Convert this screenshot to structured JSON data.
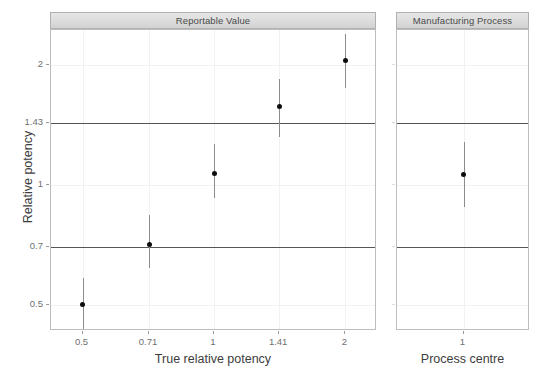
{
  "chart_data": {
    "type": "scatter",
    "title": "",
    "ylabel": "Relative potency",
    "yscale": "log",
    "ylim": [
      0.43,
      2.45
    ],
    "y_ticks": [
      {
        "label": "2",
        "value": 2
      },
      {
        "label": "1.43",
        "value": 1.43
      },
      {
        "label": "1",
        "value": 1
      },
      {
        "label": "0.7",
        "value": 0.7
      },
      {
        "label": "0.5",
        "value": 0.5
      }
    ],
    "reference_lines": [
      {
        "label": "1.43",
        "value": 1.43
      },
      {
        "label": "0.7",
        "value": 0.7
      }
    ],
    "grid": true,
    "legend": "none",
    "panels": [
      {
        "strip_label": "Reportable Value",
        "xlabel": "True relative potency",
        "x_ticks": [
          {
            "label": "0.5",
            "value": 0.5
          },
          {
            "label": "0.71",
            "value": 0.71
          },
          {
            "label": "1",
            "value": 1
          },
          {
            "label": "1.41",
            "value": 1.41
          },
          {
            "label": "2",
            "value": 2
          }
        ],
        "points": [
          {
            "x": 0.5,
            "y": 0.5,
            "lower": 0.435,
            "upper": 0.585
          },
          {
            "x": 0.71,
            "y": 0.71,
            "lower": 0.62,
            "upper": 0.84
          },
          {
            "x": 1.0,
            "y": 1.07,
            "lower": 0.93,
            "upper": 1.265
          },
          {
            "x": 1.41,
            "y": 1.57,
            "lower": 1.32,
            "upper": 1.85
          },
          {
            "x": 2.0,
            "y": 2.05,
            "lower": 1.75,
            "upper": 2.39
          }
        ]
      },
      {
        "strip_label": "Manufacturing Process",
        "xlabel": "Process centre",
        "x_ticks": [
          {
            "label": "1",
            "value": 1
          }
        ],
        "points": [
          {
            "x": 1.0,
            "y": 1.06,
            "lower": 0.88,
            "upper": 1.285
          }
        ]
      }
    ],
    "colors": {
      "point": "#0d0d0d",
      "errorbar": "#8c8c8c",
      "reference_line": "#565656",
      "grid": "#f2f2f2",
      "panel_border": "#bdbdbd",
      "strip_background": "#dcdcdc",
      "strip_border": "#b0b0b0",
      "tick_label": "#6f6f6f",
      "axis_title": "#3d3d3d",
      "background": "#ffffff"
    }
  }
}
